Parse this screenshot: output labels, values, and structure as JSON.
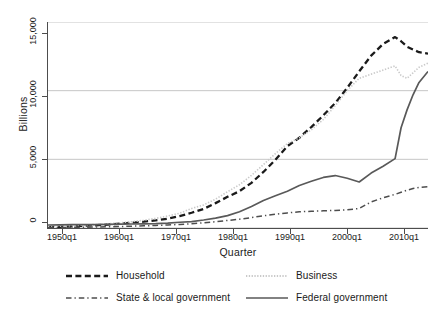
{
  "chart_data": {
    "type": "line",
    "title": "",
    "xlabel": "Quarter",
    "ylabel": "Billions",
    "grid": true,
    "legend_position": "bottom",
    "xlim": [
      1950,
      2013.5
    ],
    "ylim": [
      0,
      15000
    ],
    "xtick_labels": [
      "1950q1",
      "1960q1",
      "1970q1",
      "1980q1",
      "1990q1",
      "2000q1",
      "2010q1"
    ],
    "xtick_values": [
      1950,
      1960,
      1970,
      1980,
      1990,
      2000,
      2010
    ],
    "ytick_labels": [
      "0",
      "5,000",
      "10,000",
      "15,000"
    ],
    "ytick_values": [
      0,
      5000,
      10000,
      15000
    ],
    "x": [
      1950,
      1952,
      1954,
      1956,
      1958,
      1960,
      1962,
      1964,
      1966,
      1968,
      1970,
      1972,
      1974,
      1976,
      1978,
      1980,
      1982,
      1984,
      1986,
      1988,
      1990,
      1992,
      1994,
      1996,
      1998,
      2000,
      2002,
      2004,
      2006,
      2008,
      2009,
      2010,
      2011,
      2012,
      2013.5
    ],
    "series": [
      {
        "name": "Household",
        "style": "dashed",
        "color": "#1a1a1a",
        "width": 2.3,
        "values": [
          60,
          85,
          120,
          165,
          200,
          250,
          310,
          385,
          460,
          560,
          680,
          860,
          1110,
          1390,
          1810,
          2270,
          2680,
          3290,
          4080,
          4960,
          5960,
          6570,
          7350,
          8200,
          9100,
          10200,
          11400,
          12550,
          13400,
          13900,
          13600,
          13200,
          13000,
          12800,
          12700
        ]
      },
      {
        "name": "Business",
        "style": "dotted",
        "color": "#c9c9c9",
        "width": 1.6,
        "values": [
          100,
          135,
          165,
          215,
          260,
          310,
          380,
          460,
          560,
          700,
          870,
          1080,
          1420,
          1680,
          2100,
          2640,
          3150,
          3830,
          4620,
          5420,
          6150,
          6560,
          7150,
          7900,
          8900,
          10000,
          10900,
          11200,
          11500,
          11800,
          11100,
          10900,
          11300,
          11700,
          12000
        ]
      },
      {
        "name": "State & local government",
        "style": "dashdot",
        "color": "#4d4d4d",
        "width": 1.5,
        "values": [
          25,
          35,
          45,
          58,
          72,
          90,
          110,
          130,
          155,
          185,
          220,
          260,
          310,
          380,
          460,
          550,
          640,
          760,
          890,
          1000,
          1100,
          1180,
          1220,
          1250,
          1280,
          1330,
          1420,
          1900,
          2200,
          2450,
          2600,
          2750,
          2880,
          2960,
          3000
        ]
      },
      {
        "name": "Federal government",
        "style": "solid",
        "color": "#595959",
        "width": 1.7,
        "values": [
          220,
          230,
          240,
          240,
          250,
          260,
          275,
          290,
          300,
          320,
          360,
          420,
          470,
          580,
          720,
          900,
          1180,
          1560,
          2000,
          2350,
          2680,
          3100,
          3400,
          3680,
          3820,
          3620,
          3350,
          4000,
          4500,
          5050,
          7300,
          8600,
          9700,
          10600,
          11400
        ]
      }
    ]
  },
  "legend": {
    "entries": [
      {
        "label": "Household",
        "key": "dashed-black-key"
      },
      {
        "label": "Business",
        "key": "dotted-lightgray-key"
      },
      {
        "label": "State & local government",
        "key": "dashdot-gray-key"
      },
      {
        "label": "Federal government",
        "key": "solid-gray-key"
      }
    ]
  },
  "colors": {
    "axis": "#4d4d4d",
    "grid": "#c0c0c0",
    "household": "#1a1a1a",
    "business": "#c9c9c9",
    "state_local": "#4d4d4d",
    "federal": "#595959",
    "background": "#ffffff"
  }
}
